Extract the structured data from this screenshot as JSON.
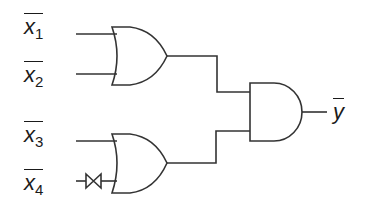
{
  "diagram": {
    "type": "logic-circuit",
    "stroke_color": "#333333",
    "inputs": [
      {
        "id": "x1",
        "base": "x",
        "subscript": "1",
        "negated": true
      },
      {
        "id": "x2",
        "base": "x",
        "subscript": "2",
        "negated": true
      },
      {
        "id": "x3",
        "base": "x",
        "subscript": "3",
        "negated": true
      },
      {
        "id": "x4",
        "base": "x",
        "subscript": "4",
        "negated": true
      }
    ],
    "output": {
      "id": "y",
      "base": "y",
      "negated": true
    },
    "gates": [
      {
        "id": "or1",
        "kind": "OR",
        "inputs": [
          "x1",
          "x2"
        ]
      },
      {
        "id": "or2",
        "kind": "OR",
        "inputs": [
          "x3",
          "x4"
        ]
      },
      {
        "id": "and1",
        "kind": "AND",
        "inputs": [
          "or1",
          "or2"
        ],
        "output": "y"
      }
    ],
    "components": [
      {
        "id": "switch",
        "kind": "transmission-gate",
        "on_input": "x4"
      }
    ]
  }
}
